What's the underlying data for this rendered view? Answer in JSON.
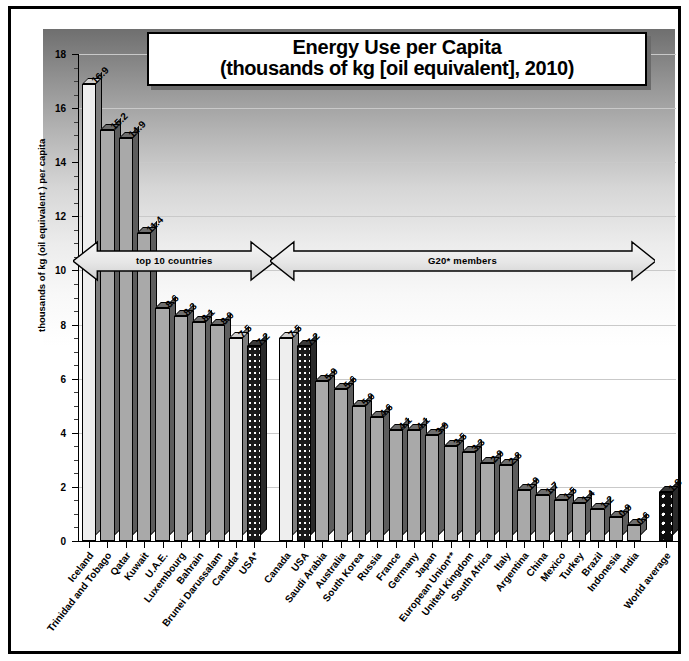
{
  "title": {
    "line1": "Energy Use per Capita",
    "line2": "(thousands of kg [oil equivalent], 2010)"
  },
  "axes": {
    "ylabel": "thousands of kg (oil equivalent ) per capita",
    "yticks": [
      "0",
      "2",
      "4",
      "6",
      "8",
      "10",
      "12",
      "14",
      "16",
      "18"
    ]
  },
  "annotations": [
    {
      "name": "top-10-countries",
      "label": "top 10 countries"
    },
    {
      "name": "g20-members",
      "label": "G20* members"
    }
  ],
  "chart_data": {
    "type": "bar",
    "title": "Energy Use per Capita (thousands of kg [oil equivalent], 2010)",
    "xlabel": "",
    "ylabel": "thousands of kg (oil equivalent ) per capita",
    "ylim": [
      0,
      18
    ],
    "ytick_step": 2,
    "grid": true,
    "legend": "none",
    "groups": [
      "top 10 countries",
      "G20* members",
      "World average"
    ],
    "categories": [
      "Iceland",
      "Trinidad and Tobago",
      "Qatar",
      "Kuwait",
      "U.A.E.",
      "Luxembourg",
      "Bahrain",
      "Brunei Darussalam",
      "Canada*",
      "USA*",
      "Canada",
      "USA",
      "Saudi Arabia",
      "Australia",
      "South Korea",
      "Russia",
      "France",
      "Germany",
      "Japan",
      "European Union**",
      "United Kingdom",
      "South Africa",
      "Italy",
      "Argentina",
      "China",
      "Mexico",
      "Turkey",
      "Brazil",
      "Indonesia",
      "India",
      "World average"
    ],
    "values": [
      16.9,
      15.2,
      14.9,
      11.4,
      8.6,
      8.3,
      8.1,
      8.0,
      7.5,
      7.2,
      7.5,
      7.2,
      5.9,
      5.6,
      5.0,
      4.6,
      4.1,
      4.1,
      3.9,
      3.5,
      3.3,
      2.9,
      2.8,
      1.9,
      1.7,
      1.5,
      1.4,
      1.2,
      0.9,
      0.6,
      1.8
    ],
    "value_labels": [
      "16.9",
      "15.2",
      "14.9",
      "11.4",
      "8.6",
      "8.3",
      "8.1",
      "8.0",
      "7.5",
      "7.2",
      "7.5",
      "7.2",
      "5.9",
      "5.6",
      "5.0",
      "4.6",
      "4.1",
      "4.1",
      "3.9",
      "3.5",
      "3.3",
      "2.9",
      "2.8",
      "1.9",
      "1.7",
      "1.5",
      "1.4",
      "1.2",
      "0.9",
      "0.6",
      "1.8"
    ],
    "bar_styles": [
      "white",
      "gray",
      "gray",
      "gray",
      "gray",
      "gray",
      "gray",
      "gray",
      "white",
      "dotted",
      "white",
      "dotted",
      "gray",
      "gray",
      "gray",
      "gray",
      "gray",
      "gray",
      "gray",
      "gray",
      "gray",
      "gray",
      "gray",
      "gray",
      "gray",
      "gray",
      "gray",
      "gray",
      "gray",
      "gray",
      "dark"
    ],
    "colors": {
      "bar_gray": "#a9a9a9",
      "bar_white": "#eeeeee",
      "bar_dark": "#0d0d0d",
      "gridline": "#c9c9c9",
      "axis": "#000000"
    }
  }
}
